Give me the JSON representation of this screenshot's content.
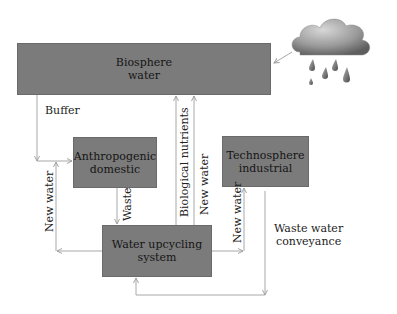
{
  "diagram": {
    "nodes": {
      "biosphere": {
        "line1": "Biosphere",
        "line2": "water"
      },
      "anthropogenic": {
        "line1": "Anthropogenic",
        "line2": "domestic"
      },
      "technosphere": {
        "line1": "Technosphere",
        "line2": "industrial"
      },
      "upcycling": {
        "line1": "Water upcycling system"
      }
    },
    "edge_labels": {
      "buffer": "Buffer",
      "new_water_left": "New water",
      "waste": "Waste",
      "biological_nutrients": "Biological nutrients",
      "new_water_center": "New water",
      "new_water_right": "New water",
      "waste_water_line1": "Waste water",
      "waste_water_line2": "conveyance"
    },
    "icons": {
      "rain_cloud": "rain-cloud-icon"
    },
    "colors": {
      "box_fill": "#7b7b7b",
      "line": "#a8a8a8",
      "background": "#ffffff"
    }
  }
}
